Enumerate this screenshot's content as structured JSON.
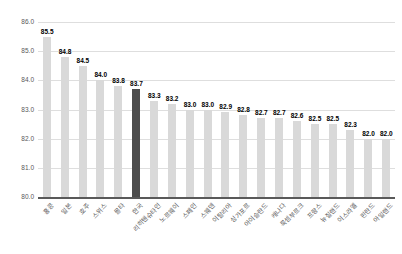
{
  "chart_data": {
    "type": "bar",
    "title": "",
    "xlabel": "",
    "ylabel": "",
    "categories": [
      "홍콩",
      "일본",
      "호주",
      "스위스",
      "몰타",
      "한국",
      "리히텐슈타인",
      "노르웨이",
      "스페인",
      "스웨덴",
      "이탈리아",
      "싱가포르",
      "아이슬란드",
      "캐나다",
      "룩셈부르크",
      "프랑스",
      "뉴질랜드",
      "이스라엘",
      "핀란드",
      "아일랜드"
    ],
    "values": [
      85.5,
      84.8,
      84.5,
      84.0,
      83.8,
      83.7,
      83.3,
      83.2,
      83.0,
      83.0,
      82.9,
      82.8,
      82.7,
      82.7,
      82.6,
      82.5,
      82.5,
      82.3,
      82.0,
      82.0
    ],
    "value_labels": [
      "85.5",
      "84.8",
      "84.5",
      "84.0",
      "83.8",
      "83.7",
      "83.3",
      "83.2",
      "83.0",
      "83.0",
      "82.9",
      "82.8",
      "82.7",
      "82.7",
      "82.6",
      "82.5",
      "82.5",
      "82.3",
      "82.0",
      "82.0"
    ],
    "highlighted_category": "한국",
    "highlight_index": 5,
    "ylim": [
      80.0,
      86.0
    ],
    "y_ticks": [
      "86.0",
      "85.0",
      "84.0",
      "83.0",
      "82.0",
      "81.0",
      "80.0"
    ],
    "grid": true,
    "legend_position": "none",
    "colors": {
      "bar": "#d9d9d9",
      "highlight": "#4d4d4d",
      "gridline": "#dedede",
      "axis_line": "#595959",
      "value_label": "#000000",
      "tick_label": "#595959"
    }
  }
}
